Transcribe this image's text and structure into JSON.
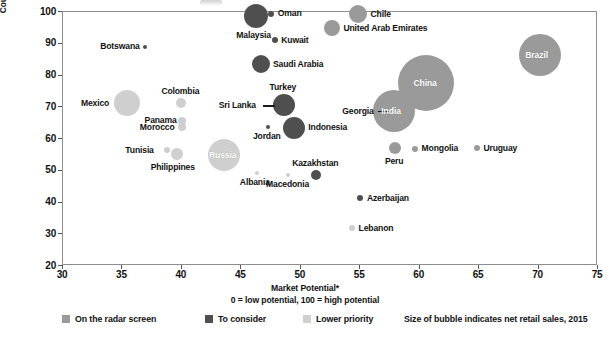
{
  "chart_data": {
    "type": "scatter",
    "title": "",
    "xlabel": "Market Potential*",
    "xlabel_sub": "0 = low potential, 100 = high potential",
    "ylabel_line1": "Country Risk (economic and political)",
    "ylabel_line2": "0 = high risk, 100 = low risk",
    "xlim": [
      30,
      75
    ],
    "ylim": [
      20,
      100
    ],
    "xticks": [
      30,
      35,
      40,
      45,
      50,
      55,
      60,
      65,
      70,
      75
    ],
    "yticks": [
      20,
      30,
      40,
      50,
      60,
      70,
      80,
      90,
      100
    ],
    "grid": false,
    "legend_position": "bottom",
    "size_note": "Size of bubble indicates net retail sales, 2015",
    "categories": [
      {
        "key": "radar",
        "label": "On the radar screen",
        "color": "#9a9a9a"
      },
      {
        "key": "consider",
        "label": "To consider",
        "color": "#4f4f4f"
      },
      {
        "key": "lower",
        "label": "Lower priority",
        "color": "#cfcfcf"
      }
    ],
    "points": [
      {
        "name": "Oman",
        "x": 47.6,
        "y": 99.2,
        "size": 3,
        "cat": "consider",
        "label_pos": "right"
      },
      {
        "name": "Chile",
        "x": 54.9,
        "y": 99.0,
        "size": 9,
        "cat": "radar",
        "label_pos": "right"
      },
      {
        "name": "Malaysia",
        "x": 46.3,
        "y": 98.3,
        "size": 12,
        "cat": "consider",
        "label_pos": "below"
      },
      {
        "name": "United Arab Emirates",
        "x": 52.7,
        "y": 94.6,
        "size": 8,
        "cat": "radar",
        "label_pos": "right"
      },
      {
        "name": "Kuwait",
        "x": 47.9,
        "y": 90.8,
        "size": 3,
        "cat": "consider",
        "label_pos": "right"
      },
      {
        "name": "Botswana",
        "x": 37.0,
        "y": 88.8,
        "size": 2,
        "cat": "consider",
        "label_pos": "left"
      },
      {
        "name": "Brazil",
        "x": 70.2,
        "y": 86.0,
        "size": 21,
        "cat": "radar",
        "label_pos": "inside"
      },
      {
        "name": "Saudi Arabia",
        "x": 46.7,
        "y": 83.3,
        "size": 9,
        "cat": "consider",
        "label_pos": "right"
      },
      {
        "name": "Colombia",
        "x": 40.0,
        "y": 71.0,
        "size": 5,
        "cat": "lower",
        "label_pos": "above"
      },
      {
        "name": "Mexico",
        "x": 35.5,
        "y": 71.0,
        "size": 13,
        "cat": "lower",
        "label_pos": "left"
      },
      {
        "name": "Turkey",
        "x": 48.7,
        "y": 70.5,
        "size": 11,
        "cat": "consider",
        "label_pos": "above"
      },
      {
        "name": "Sri Lanka",
        "x": 48.2,
        "y": 70.2,
        "size": 2,
        "cat": "consider",
        "label_pos": "leader-left"
      },
      {
        "name": "China",
        "x": 60.6,
        "y": 77.3,
        "size": 28,
        "cat": "radar",
        "label_pos": "inside"
      },
      {
        "name": "Georgia",
        "x": 57.8,
        "y": 68.5,
        "size": 2,
        "cat": "radar",
        "label_pos": "leader-left"
      },
      {
        "name": "India",
        "x": 57.9,
        "y": 68.4,
        "size": 21,
        "cat": "radar",
        "label_pos": "inside"
      },
      {
        "name": "Panama",
        "x": 40.1,
        "y": 65.5,
        "size": 4,
        "cat": "lower",
        "label_pos": "left"
      },
      {
        "name": "Morocco",
        "x": 40.1,
        "y": 63.4,
        "size": 4,
        "cat": "lower",
        "label_pos": "left"
      },
      {
        "name": "Jordan",
        "x": 47.3,
        "y": 63.6,
        "size": 2,
        "cat": "consider",
        "label_pos": "below"
      },
      {
        "name": "Indonesia",
        "x": 49.5,
        "y": 63.3,
        "size": 11,
        "cat": "consider",
        "label_pos": "right"
      },
      {
        "name": "Tunisia",
        "x": 38.8,
        "y": 56.2,
        "size": 3,
        "cat": "lower",
        "label_pos": "left"
      },
      {
        "name": "Philippines",
        "x": 39.7,
        "y": 55.0,
        "size": 6,
        "cat": "lower",
        "label_pos": "below"
      },
      {
        "name": "Russia",
        "x": 43.6,
        "y": 54.5,
        "size": 16,
        "cat": "lower",
        "label_pos": "inside"
      },
      {
        "name": "Peru",
        "x": 58.0,
        "y": 57.0,
        "size": 6,
        "cat": "radar",
        "label_pos": "below"
      },
      {
        "name": "Mongolia",
        "x": 59.7,
        "y": 56.6,
        "size": 3,
        "cat": "radar",
        "label_pos": "right"
      },
      {
        "name": "Uruguay",
        "x": 64.9,
        "y": 56.8,
        "size": 3,
        "cat": "radar",
        "label_pos": "right"
      },
      {
        "name": "Albania",
        "x": 46.4,
        "y": 49.0,
        "size": 2,
        "cat": "lower",
        "label_pos": "below"
      },
      {
        "name": "Macedonia",
        "x": 49.0,
        "y": 48.5,
        "size": 2,
        "cat": "lower",
        "label_pos": "below"
      },
      {
        "name": "Kazakhstan",
        "x": 51.4,
        "y": 48.4,
        "size": 5,
        "cat": "consider",
        "label_pos": "above"
      },
      {
        "name": "Azerbaijan",
        "x": 55.1,
        "y": 41.0,
        "size": 3,
        "cat": "consider",
        "label_pos": "right"
      },
      {
        "name": "Lebanon",
        "x": 54.4,
        "y": 31.5,
        "size": 3,
        "cat": "lower",
        "label_pos": "right"
      }
    ]
  },
  "axis": {
    "y_title_line1": "Country Risk (economic and political)",
    "y_title_line2": "0 = high risk, 100 = low risk",
    "x_title_line1": "Market Potential*",
    "x_title_line2": "0 = low potential, 100 = high potential"
  },
  "legend": {
    "items": [
      {
        "label": "On the radar screen",
        "color": "#9a9a9a"
      },
      {
        "label": "To consider",
        "color": "#4f4f4f"
      },
      {
        "label": "Lower priority",
        "color": "#cfcfcf"
      }
    ],
    "size_note": "Size of bubble indicates net retail sales, 2015"
  }
}
